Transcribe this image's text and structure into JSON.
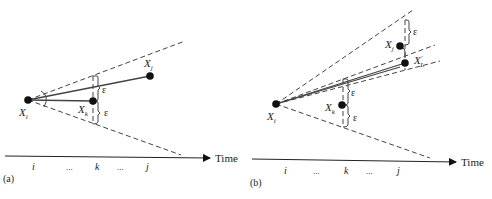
{
  "panels": [
    {
      "id": "a",
      "label": "(a)",
      "points": {
        "xi": {
          "name": "X",
          "sub": "i"
        },
        "xk": {
          "name": "X",
          "sub": "k"
        },
        "xj": {
          "name": "X",
          "sub": "j"
        }
      },
      "epsilon": [
        "ε",
        "ε"
      ],
      "axis": {
        "label": "Time",
        "ticks": [
          "i",
          "...",
          "k",
          "...",
          "j"
        ]
      }
    },
    {
      "id": "b",
      "label": "(b)",
      "points": {
        "xi": {
          "name": "X",
          "sub": "i"
        },
        "xk": {
          "name": "X",
          "sub": "k"
        },
        "xj": {
          "name": "X",
          "sub": "j"
        },
        "xl": {
          "name": "X",
          "sub": "L",
          "prime": "'"
        }
      },
      "epsilon": [
        "ε",
        "ε",
        "ε"
      ],
      "axis": {
        "label": "Time",
        "ticks": [
          "i",
          "...",
          "k",
          "...",
          "j"
        ]
      }
    }
  ]
}
